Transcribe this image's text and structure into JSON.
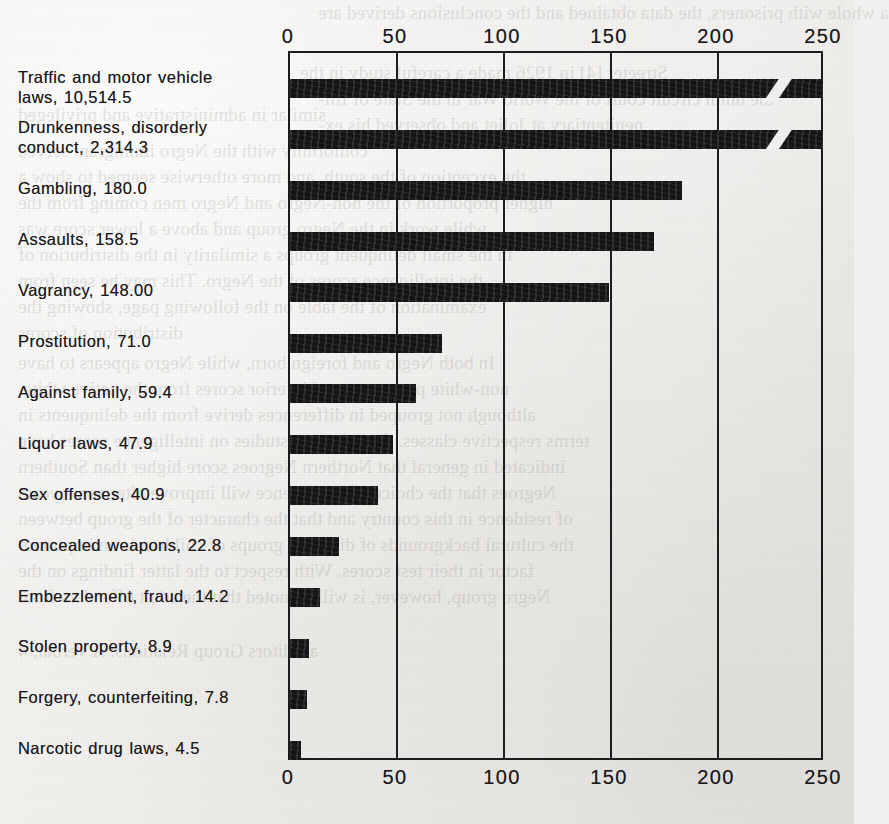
{
  "chart_data": {
    "type": "bar",
    "orientation": "horizontal",
    "title": "",
    "xlabel": "",
    "ylabel": "",
    "xlim": [
      0,
      250
    ],
    "grid": true,
    "legend": false,
    "axis_break_note": "Top two bars exceed the 250 scale and are drawn with a diagonal break mark near 225",
    "tick_labels": [
      "0",
      "50",
      "100",
      "150",
      "200",
      "250"
    ],
    "tick_values": [
      0,
      50,
      100,
      150,
      200,
      250
    ],
    "categories": [
      "Traffic and motor vehicle laws",
      "Drunkenness, disorderly conduct",
      "Gambling",
      "Assaults",
      "Vagrancy",
      "Prostitution",
      "Against family",
      "Liquor laws",
      "Sex offenses",
      "Concealed weapons",
      "Embezzlement, fraud",
      "Stolen property",
      "Forgery, counterfeiting",
      "Narcotic drug laws"
    ],
    "values": [
      10514.5,
      2314.3,
      180.0,
      158.5,
      148.0,
      71.0,
      59.4,
      47.9,
      40.9,
      22.8,
      14.2,
      8.9,
      7.8,
      4.5
    ],
    "value_labels": [
      "10,514.5",
      "2,314.3",
      "180.0",
      "158.5",
      "148.00",
      "71.0",
      "59.4",
      "47.9",
      "40.9",
      "22.8",
      "14.2",
      "8.9",
      "7.8",
      "4.5"
    ],
    "plotted_lengths": [
      262,
      262,
      183,
      170,
      149,
      71,
      59,
      48,
      41,
      23,
      14,
      9,
      8,
      5
    ]
  },
  "rows": [
    {
      "label": "Traffic and motor vehicle laws, 10,514.5",
      "line1": "Traffic and motor vehicle",
      "line2": "laws, 10,514.5",
      "value": 10514.5,
      "plotted": 262,
      "overflow": true
    },
    {
      "label": "Drunkenness, disorderly conduct, 2,314.3",
      "line1": "Drunkenness, disorderly",
      "line2": "conduct, 2,314.3",
      "value": 2314.3,
      "plotted": 262,
      "overflow": true
    },
    {
      "label": "Gambling, 180.0",
      "line1": "Gambling, 180.0",
      "line2": "",
      "value": 180.0,
      "plotted": 183,
      "overflow": false
    },
    {
      "label": "Assaults, 158.5",
      "line1": "Assaults, 158.5",
      "line2": "",
      "value": 158.5,
      "plotted": 170,
      "overflow": false
    },
    {
      "label": "Vagrancy, 148.00",
      "line1": "Vagrancy, 148.00",
      "line2": "",
      "value": 148.0,
      "plotted": 149,
      "overflow": false
    },
    {
      "label": "Prostitution, 71.0",
      "line1": "Prostitution, 71.0",
      "line2": "",
      "value": 71.0,
      "plotted": 71,
      "overflow": false
    },
    {
      "label": "Against family, 59.4",
      "line1": "Against family, 59.4",
      "line2": "",
      "value": 59.4,
      "plotted": 59,
      "overflow": false
    },
    {
      "label": "Liquor laws, 47.9",
      "line1": "Liquor laws, 47.9",
      "line2": "",
      "value": 47.9,
      "plotted": 48,
      "overflow": false
    },
    {
      "label": "Sex offenses, 40.9",
      "line1": "Sex offenses, 40.9",
      "line2": "",
      "value": 40.9,
      "plotted": 41,
      "overflow": false
    },
    {
      "label": "Concealed weapons, 22.8",
      "line1": "Concealed weapons, 22.8",
      "line2": "",
      "value": 22.8,
      "plotted": 23,
      "overflow": false
    },
    {
      "label": "Embezzlement, fraud, 14.2",
      "line1": "Embezzlement, fraud, 14.2",
      "line2": "",
      "value": 14.2,
      "plotted": 14,
      "overflow": false
    },
    {
      "label": "Stolen property, 8.9",
      "line1": "Stolen property, 8.9",
      "line2": "",
      "value": 8.9,
      "plotted": 9,
      "overflow": false
    },
    {
      "label": "Forgery, counterfeiting, 7.8",
      "line1": "Forgery, counterfeiting, 7.8",
      "line2": "",
      "value": 7.8,
      "plotted": 8,
      "overflow": false
    },
    {
      "label": "Narcotic drug laws, 4.5",
      "line1": "Narcotic drug laws, 4.5",
      "line2": "",
      "value": 4.5,
      "plotted": 5,
      "overflow": false
    }
  ],
  "ghost_text": {
    "lines": [
      "a whole with prisoners, the data obtained and the conclusions derived are",
      "similar in administrative and privileged",
      "Streeter [4] in 1926 made a careful study in the",
      "the ninth circuit court of the World War in the State of Illi-",
      "penitentiary at Joliet and observed his ex-",
      "conformity with the Negro immigrant served",
      "the exception of the south, and more otherwise seemed to show a",
      "higher proportion of the non-Negro and Negro men coming from the",
      "while work in the Negro group and above a lower score was",
      "in the small delinquent groups a similarity in the distribution of",
      "the intelligence scores of the Negro. This may be seen from",
      "examination of the table on the following page, showing the",
      "distribution of scores",
      "In both Negro and foreign born, while Negro appears to have",
      "non-white percentages of inferior scores from the native white,",
      "although not grouped in differences derive from the delinquents in",
      "terms respective classes. Comparative studies on intelligence scores have",
      "indicated in general that Northern Negroes score higher than Southern",
      "Negroes that the choice of intelligence will improve after some years",
      "of residence in this country and that the character of the group between",
      "the cultural backgrounds of different groups of children is an important",
      "factor in their test scores. With respect to the latter findings on the",
      "Negro group, however, is will be noted that the adult offenders from",
      "a Editors Group Relations: A Verbal, 4"
    ],
    "positions": [
      [
        318,
        2
      ],
      [
        18,
        104
      ],
      [
        300,
        62
      ],
      [
        318,
        88
      ],
      [
        318,
        114
      ],
      [
        18,
        140
      ],
      [
        18,
        166
      ],
      [
        18,
        192
      ],
      [
        18,
        218
      ],
      [
        18,
        244
      ],
      [
        18,
        270
      ],
      [
        18,
        296
      ],
      [
        18,
        322
      ],
      [
        18,
        352
      ],
      [
        18,
        378
      ],
      [
        18,
        404
      ],
      [
        18,
        430
      ],
      [
        18,
        456
      ],
      [
        18,
        482
      ],
      [
        18,
        508
      ],
      [
        18,
        534
      ],
      [
        18,
        560
      ],
      [
        18,
        586
      ],
      [
        18,
        640
      ]
    ]
  }
}
